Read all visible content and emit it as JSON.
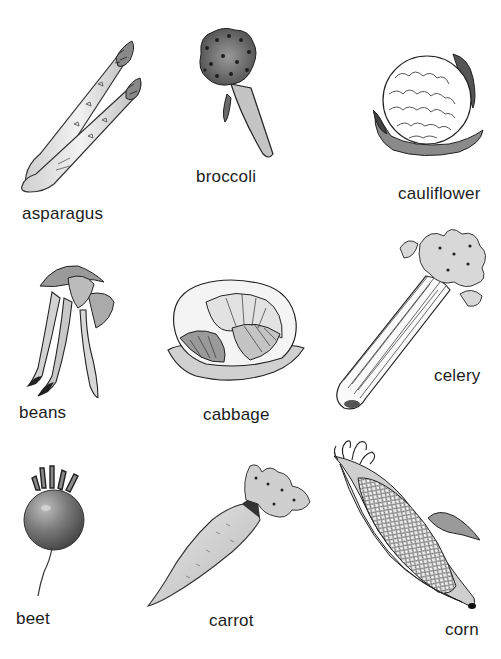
{
  "sheet": {
    "title": "",
    "background": "#ffffff",
    "items": [
      {
        "id": "asparagus",
        "label": "asparagus"
      },
      {
        "id": "broccoli",
        "label": "broccoli"
      },
      {
        "id": "cauliflower",
        "label": "cauliflower"
      },
      {
        "id": "beans",
        "label": "beans"
      },
      {
        "id": "cabbage",
        "label": "cabbage"
      },
      {
        "id": "celery",
        "label": "celery"
      },
      {
        "id": "beet",
        "label": "beet"
      },
      {
        "id": "carrot",
        "label": "carrot"
      },
      {
        "id": "corn",
        "label": "corn"
      }
    ]
  }
}
